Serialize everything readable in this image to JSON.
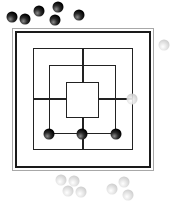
{
  "game": {
    "name": "Nine Men's Morris",
    "colors": {
      "black_piece": "#000000",
      "white_piece": "#d0d0d0",
      "board_line": "#222222",
      "frame": "#a8a8a8"
    }
  },
  "board": {
    "squares": [
      {
        "name": "outer",
        "x": 33,
        "y": 48,
        "w": 100,
        "h": 102
      },
      {
        "name": "middle",
        "x": 49,
        "y": 65,
        "w": 67,
        "h": 69
      },
      {
        "name": "inner",
        "x": 66,
        "y": 82,
        "w": 33,
        "h": 36
      }
    ],
    "placed_pieces": [
      {
        "color": "white",
        "x": 132,
        "y": 99
      },
      {
        "color": "black",
        "x": 49,
        "y": 134
      },
      {
        "color": "black",
        "x": 82,
        "y": 134
      },
      {
        "color": "black",
        "x": 116,
        "y": 134
      }
    ]
  },
  "reserve": {
    "black": [
      {
        "x": 12,
        "y": 17
      },
      {
        "x": 25,
        "y": 19
      },
      {
        "x": 39,
        "y": 11
      },
      {
        "x": 58,
        "y": 7
      },
      {
        "x": 55,
        "y": 20
      },
      {
        "x": 79,
        "y": 15
      }
    ],
    "white": [
      {
        "x": 61,
        "y": 180
      },
      {
        "x": 74,
        "y": 181
      },
      {
        "x": 68,
        "y": 191
      },
      {
        "x": 81,
        "y": 192
      },
      {
        "x": 112,
        "y": 189
      },
      {
        "x": 124,
        "y": 182
      },
      {
        "x": 128,
        "y": 195
      },
      {
        "x": 164,
        "y": 45
      }
    ]
  }
}
